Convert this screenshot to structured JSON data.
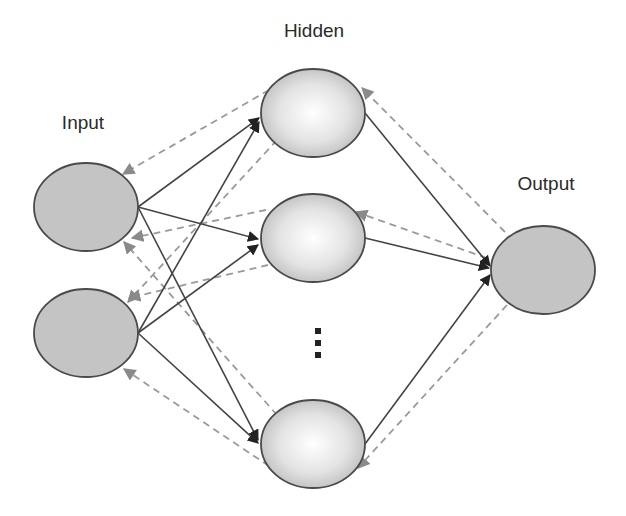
{
  "diagram": {
    "type": "neural-network",
    "labels": {
      "input": "Input",
      "hidden": "Hidden",
      "output": "Output",
      "ellipsis": "⋮"
    },
    "colors": {
      "input_fill": "#c4c4c4",
      "output_fill": "#c4c4c4",
      "hidden_fill_center": "#ffffff",
      "hidden_fill_edge": "#bdbdbd",
      "node_stroke": "#4a4a4a",
      "forward_edge": "#444444",
      "backward_edge": "#9a9a9a"
    },
    "layers": [
      {
        "name": "input",
        "nodes": [
          "input-1",
          "input-2"
        ]
      },
      {
        "name": "hidden",
        "nodes": [
          "hidden-1",
          "hidden-2",
          "hidden-n"
        ]
      },
      {
        "name": "output",
        "nodes": [
          "output-1"
        ]
      }
    ],
    "edges": {
      "forward_style": "solid-arrow",
      "backward_style": "dashed-arrow",
      "forward": [
        [
          "input-1",
          "hidden-1"
        ],
        [
          "input-1",
          "hidden-2"
        ],
        [
          "input-1",
          "hidden-n"
        ],
        [
          "input-2",
          "hidden-1"
        ],
        [
          "input-2",
          "hidden-2"
        ],
        [
          "input-2",
          "hidden-n"
        ],
        [
          "hidden-1",
          "output-1"
        ],
        [
          "hidden-2",
          "output-1"
        ],
        [
          "hidden-n",
          "output-1"
        ]
      ],
      "backward": [
        [
          "hidden-1",
          "input-1"
        ],
        [
          "hidden-1",
          "input-2"
        ],
        [
          "hidden-2",
          "input-1"
        ],
        [
          "hidden-2",
          "input-2"
        ],
        [
          "hidden-n",
          "input-1"
        ],
        [
          "hidden-n",
          "input-2"
        ],
        [
          "output-1",
          "hidden-1"
        ],
        [
          "output-1",
          "hidden-2"
        ],
        [
          "output-1",
          "hidden-n"
        ]
      ]
    }
  }
}
